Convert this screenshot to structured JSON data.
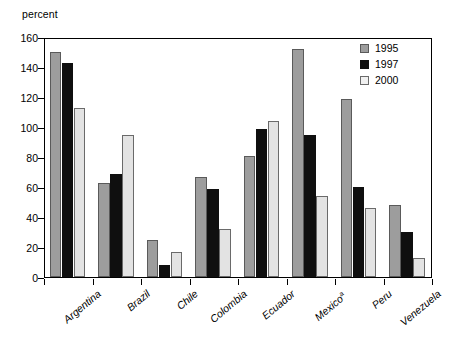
{
  "chart_data": {
    "type": "bar",
    "title": "",
    "subtitle": "",
    "xlabel": "",
    "ylabel": "percent",
    "ylim": [
      0,
      160
    ],
    "ytick_labels": [
      "160",
      "140",
      "120",
      "100",
      "80",
      "60",
      "40",
      "20",
      "0"
    ],
    "ytick_values": [
      160,
      140,
      120,
      100,
      80,
      60,
      40,
      20,
      0
    ],
    "grid": false,
    "legend_position": "top-right-inside",
    "categories": [
      "Argentina",
      "Brazil",
      "Chile",
      "Colombia",
      "Ecuador",
      "Mexico",
      "Peru",
      "Venezuela"
    ],
    "category_labels": [
      "Argentina",
      "Brazil",
      "Chile",
      "Colombia",
      "Ecuador",
      "Mexico",
      "Peru",
      "Venezuela"
    ],
    "category_footnotes": [
      "",
      "",
      "",
      "",
      "",
      "a",
      "",
      ""
    ],
    "series": [
      {
        "name": "1995",
        "color": "#9d9d9d",
        "values": [
          150,
          63,
          25,
          67,
          81,
          152,
          119,
          48
        ]
      },
      {
        "name": "1997",
        "color": "#0f0f0f",
        "values": [
          143,
          69,
          8,
          59,
          99,
          95,
          60,
          30
        ]
      },
      {
        "name": "2000",
        "color": "#e3e3e3",
        "values": [
          113,
          95,
          17,
          32,
          104,
          54,
          46,
          13
        ]
      }
    ]
  },
  "legend": {
    "entries": [
      {
        "label": "1995",
        "series_class": "s1995"
      },
      {
        "label": "1997",
        "series_class": "s1997"
      },
      {
        "label": "2000",
        "series_class": "s2000"
      }
    ]
  },
  "colors": {
    "series_1995": "#9d9d9d",
    "series_1997": "#0f0f0f",
    "series_2000": "#e3e3e3",
    "axis": "#000000",
    "background": "#ffffff"
  }
}
